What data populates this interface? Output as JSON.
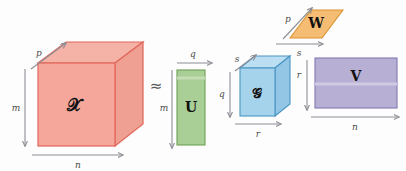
{
  "figure": {
    "background_color": "#fdfdfd",
    "approx_symbol": "≈"
  },
  "palette": {
    "x_front": "#f4a79a",
    "x_top": "#f5b2a6",
    "x_side": "#efa093",
    "x_stroke": "#e2675a",
    "u_fill": "#a9cf96",
    "u_stroke": "#6ea055",
    "g_front": "#a6d3ec",
    "g_top": "#bcdef2",
    "g_side": "#92c6e4",
    "g_stroke": "#4a96c4",
    "w_fill": "#f5bd74",
    "w_stroke": "#d99432",
    "v_fill": "#b8afd4",
    "v_stroke": "#8277b3",
    "arrow": "#8e8e96",
    "text": "#111111",
    "dim_text": "#4b4b4b"
  },
  "tensors": [
    {
      "id": "x-tensor",
      "label": "𝒳",
      "plain_label": "X",
      "shape": "cube",
      "color": "#f4a79a",
      "dims": [
        {
          "name": "p",
          "position": "top-left-diagonal"
        },
        {
          "name": "m",
          "position": "left-vertical"
        },
        {
          "name": "n",
          "position": "bottom-horizontal"
        }
      ]
    },
    {
      "id": "u-matrix",
      "label": "U",
      "plain_label": "U",
      "shape": "rectangle",
      "color": "#a9cf96",
      "dims": [
        {
          "name": "q",
          "position": "top-horizontal"
        },
        {
          "name": "m",
          "position": "left-vertical"
        }
      ]
    },
    {
      "id": "g-core-tensor",
      "label": "𝒢",
      "plain_label": "G",
      "shape": "cube",
      "color": "#a6d3ec",
      "dims": [
        {
          "name": "s",
          "position": "top-left-diagonal"
        },
        {
          "name": "s",
          "position": "top-horizontal"
        },
        {
          "name": "q",
          "position": "left-vertical"
        },
        {
          "name": "r",
          "position": "bottom-horizontal"
        }
      ]
    },
    {
      "id": "w-matrix",
      "label": "W",
      "plain_label": "W",
      "shape": "parallelogram",
      "color": "#f5bd74",
      "dims": [
        {
          "name": "p",
          "position": "left-diagonal"
        },
        {
          "name": "s",
          "position": "bottom-horizontal"
        }
      ]
    },
    {
      "id": "v-matrix",
      "label": "V",
      "plain_label": "V",
      "shape": "rectangle",
      "color": "#b8afd4",
      "dims": [
        {
          "name": "r",
          "position": "left-vertical"
        },
        {
          "name": "n",
          "position": "bottom-horizontal"
        }
      ]
    }
  ],
  "labels": {
    "x": "𝒳",
    "u": "U",
    "g": "𝒢",
    "w": "W",
    "v": "V",
    "approx": "≈",
    "dim_p_x": "p",
    "dim_m_x": "m",
    "dim_n_x": "n",
    "dim_q_u_top": "q",
    "dim_m_u": "m",
    "dim_s_g_diag": "s",
    "dim_s_g_top": "s",
    "dim_q_g": "q",
    "dim_r_g_bottom": "r",
    "dim_p_w": "p",
    "dim_s_w": "s",
    "dim_r_v": "r",
    "dim_n_v": "n"
  }
}
